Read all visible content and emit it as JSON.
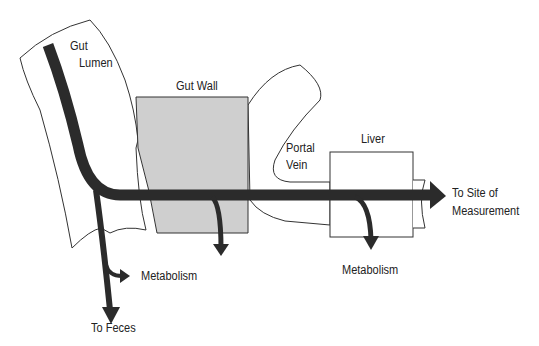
{
  "diagram": {
    "type": "pharmacokinetic first-pass flow",
    "colors": {
      "flow_arrow": "#2b2b2b",
      "gut_wall_fill": "#cfcfcf",
      "outline": "#333333",
      "background": "#ffffff"
    },
    "labels": {
      "gut_lumen_line1": "Gut",
      "gut_lumen_line2": "Lumen",
      "gut_wall": "Gut Wall",
      "portal_vein_line1": "Portal",
      "portal_vein_line2": "Vein",
      "liver": "Liver",
      "site_line1": "To Site of",
      "site_line2": "Measurement",
      "metabolism_gut": "Metabolism",
      "metabolism_liver": "Metabolism",
      "to_feces": "To Feces"
    },
    "nodes": [
      {
        "id": "gut-lumen",
        "label": "Gut Lumen"
      },
      {
        "id": "gut-wall",
        "label": "Gut Wall"
      },
      {
        "id": "portal-vein",
        "label": "Portal Vein"
      },
      {
        "id": "liver",
        "label": "Liver"
      },
      {
        "id": "site-of-measurement",
        "label": "To Site of Measurement"
      }
    ],
    "edges": [
      {
        "from": "gut-lumen",
        "to": "gut-wall"
      },
      {
        "from": "gut-wall",
        "to": "portal-vein"
      },
      {
        "from": "portal-vein",
        "to": "liver"
      },
      {
        "from": "liver",
        "to": "site-of-measurement"
      },
      {
        "from": "gut-lumen",
        "to": "Metabolism"
      },
      {
        "from": "gut-lumen",
        "to": "To Feces"
      },
      {
        "from": "gut-wall",
        "to": "metabolism (unlabeled branch)"
      },
      {
        "from": "liver",
        "to": "Metabolism"
      }
    ]
  }
}
